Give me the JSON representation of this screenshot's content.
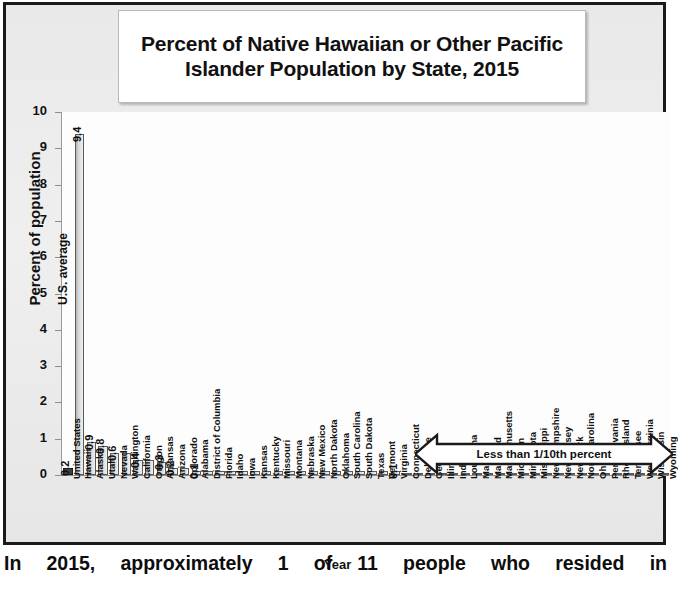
{
  "chart_data": {
    "type": "bar",
    "title": "Percent of Native Hawaiian or Other Pacific Islander Population by State, 2015",
    "xlabel": "Year",
    "ylabel": "Percent of population",
    "ylim": [
      0,
      10
    ],
    "yticks": [
      "0",
      "1",
      "2",
      "3",
      "4",
      "5",
      "6",
      "7",
      "8",
      "9",
      "10"
    ],
    "grid": true,
    "legend": "none",
    "categories": [
      "United States",
      "Hawaii",
      "Alaska",
      "Utah",
      "Nevada",
      "Washington",
      "California",
      "Oregon",
      "Arkansas",
      "Arizona",
      "Colorado",
      "Alabama",
      "District of Columbia",
      "Florida",
      "Idaho",
      "Iowa",
      "Kansas",
      "Kentucky",
      "Missouri",
      "Montana",
      "Nebraska",
      "New Mexico",
      "North Dakota",
      "Oklahoma",
      "South Carolina",
      "South Dakota",
      "Texas",
      "Vermont",
      "Virginia",
      "Connecticut",
      "Delaware",
      "Georgia",
      "Illinois",
      "Indiana",
      "Louisiana",
      "Maine",
      "Maryland",
      "Massachusetts",
      "Michigan",
      "Minnesota",
      "Mississippi",
      "New Hampshire",
      "New Jersey",
      "New York",
      "North Carolina",
      "Ohio",
      "Pennsylvania",
      "Rhode Island",
      "Tennessee",
      "West Virginia",
      "Wisconsin",
      "Wyoming"
    ],
    "values": [
      0.2,
      9.4,
      0.9,
      0.8,
      0.6,
      0.6,
      0.4,
      0.4,
      0.35,
      0.2,
      0.2,
      0.1,
      0.1,
      0.1,
      0.1,
      0.1,
      0.1,
      0.1,
      0.1,
      0.1,
      0.1,
      0.1,
      0.1,
      0.1,
      0.1,
      0.1,
      0.1,
      0.1,
      0.1,
      0.03,
      0.03,
      0.03,
      0.03,
      0.03,
      0.03,
      0.03,
      0.03,
      0.03,
      0.03,
      0.03,
      0.03,
      0.03,
      0.03,
      0.03,
      0.03,
      0.03,
      0.03,
      0.03,
      0.03,
      0.03,
      0.03,
      0.03
    ],
    "data_labels": [
      {
        "category": "United States",
        "text": "0.2"
      },
      {
        "category": "Hawaii",
        "text": "9.4"
      },
      {
        "category": "Alaska",
        "text": "0.9"
      },
      {
        "category": "Utah",
        "text": "0.8"
      },
      {
        "category": "Nevada",
        "text": "0.6"
      },
      {
        "category": "California",
        "text": "0.4"
      },
      {
        "category": "Arkansas",
        "text": "0.3"
      },
      {
        "category": "Arizona",
        "text": "0.2"
      },
      {
        "category": "Alabama",
        "text": "0.1"
      },
      {
        "category": "Virginia",
        "text": "0.1"
      }
    ],
    "annotations": [
      {
        "name": "us-average",
        "text": "U.S. average"
      },
      {
        "name": "less-than-tenth",
        "text": "Less than 1/10th percent"
      }
    ],
    "colors": {
      "us_bar": "#3a3a3a",
      "state_bar": "#d8d8d8",
      "bar_outline": "#5a5a5a",
      "gridline": "#c8c8c8",
      "plot_background": "#fdfdfd",
      "chart_background": "#eeeeee",
      "frame": "#1a1a1a",
      "text": "#111111"
    }
  },
  "caption": {
    "text": "In 2015, approximately 1 of 11 people who resided in"
  }
}
